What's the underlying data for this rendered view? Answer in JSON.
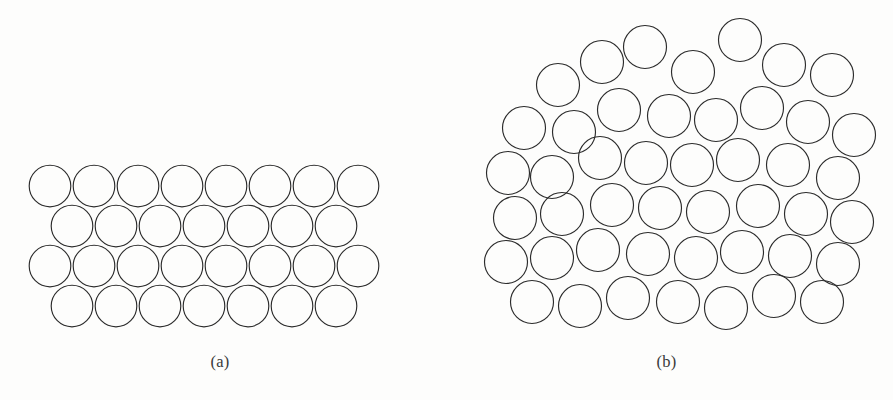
{
  "figure": {
    "title": "Schematic diagrams of atomic packing: crystalline versus amorphous solids",
    "background_color": "#fdfdfc",
    "stroke_color": "#2b2b2b",
    "fill_color": "none",
    "stroke_width": 1.15,
    "width": 893,
    "height": 400
  },
  "panels": [
    {
      "id": "a",
      "caption": "(a)",
      "description": "Crystalline solid: ordered, periodic hexagonal close-packed arrangement of atoms in four rows",
      "structure_type": "crystalline",
      "atom_count": 30,
      "rows": 4,
      "row_counts": [
        8,
        7,
        8,
        7
      ],
      "circle_radius": 20.8,
      "viewbox": "0 0 440 400",
      "circles": [
        {
          "cx": 50,
          "cy": 186
        },
        {
          "cx": 94,
          "cy": 186
        },
        {
          "cx": 138,
          "cy": 186
        },
        {
          "cx": 182,
          "cy": 186
        },
        {
          "cx": 226,
          "cy": 186
        },
        {
          "cx": 270,
          "cy": 186
        },
        {
          "cx": 314,
          "cy": 186
        },
        {
          "cx": 358,
          "cy": 186
        },
        {
          "cx": 72,
          "cy": 226
        },
        {
          "cx": 116,
          "cy": 226
        },
        {
          "cx": 160,
          "cy": 226
        },
        {
          "cx": 204,
          "cy": 226
        },
        {
          "cx": 248,
          "cy": 226
        },
        {
          "cx": 292,
          "cy": 226
        },
        {
          "cx": 336,
          "cy": 226
        },
        {
          "cx": 50,
          "cy": 266
        },
        {
          "cx": 94,
          "cy": 266
        },
        {
          "cx": 138,
          "cy": 266
        },
        {
          "cx": 182,
          "cy": 266
        },
        {
          "cx": 226,
          "cy": 266
        },
        {
          "cx": 270,
          "cy": 266
        },
        {
          "cx": 314,
          "cy": 266
        },
        {
          "cx": 358,
          "cy": 266
        },
        {
          "cx": 72,
          "cy": 306
        },
        {
          "cx": 116,
          "cy": 306
        },
        {
          "cx": 160,
          "cy": 306
        },
        {
          "cx": 204,
          "cy": 306
        },
        {
          "cx": 248,
          "cy": 306
        },
        {
          "cx": 292,
          "cy": 306
        },
        {
          "cx": 336,
          "cy": 306
        }
      ]
    },
    {
      "id": "b",
      "caption": "(b)",
      "description": "Amorphous solid: disordered, non-periodic random close packing of atoms",
      "structure_type": "amorphous",
      "atom_count": 41,
      "rows": 6,
      "circle_radius": 21.5,
      "viewbox": "0 0 453 400",
      "circles": [
        {
          "cx": 118,
          "cy": 85
        },
        {
          "cx": 162,
          "cy": 62
        },
        {
          "cx": 205,
          "cy": 47
        },
        {
          "cx": 253,
          "cy": 72
        },
        {
          "cx": 300,
          "cy": 40
        },
        {
          "cx": 344,
          "cy": 65
        },
        {
          "cx": 392,
          "cy": 75
        },
        {
          "cx": 84,
          "cy": 128
        },
        {
          "cx": 134,
          "cy": 132
        },
        {
          "cx": 179,
          "cy": 110
        },
        {
          "cx": 229,
          "cy": 116
        },
        {
          "cx": 276,
          "cy": 120
        },
        {
          "cx": 322,
          "cy": 108
        },
        {
          "cx": 368,
          "cy": 122
        },
        {
          "cx": 414,
          "cy": 135
        },
        {
          "cx": 68,
          "cy": 173
        },
        {
          "cx": 112,
          "cy": 177
        },
        {
          "cx": 160,
          "cy": 158
        },
        {
          "cx": 206,
          "cy": 163
        },
        {
          "cx": 252,
          "cy": 165
        },
        {
          "cx": 298,
          "cy": 160
        },
        {
          "cx": 348,
          "cy": 165
        },
        {
          "cx": 398,
          "cy": 178
        },
        {
          "cx": 75,
          "cy": 218
        },
        {
          "cx": 122,
          "cy": 214
        },
        {
          "cx": 172,
          "cy": 205
        },
        {
          "cx": 220,
          "cy": 208
        },
        {
          "cx": 268,
          "cy": 212
        },
        {
          "cx": 318,
          "cy": 206
        },
        {
          "cx": 366,
          "cy": 214
        },
        {
          "cx": 412,
          "cy": 222
        },
        {
          "cx": 66,
          "cy": 262
        },
        {
          "cx": 112,
          "cy": 258
        },
        {
          "cx": 158,
          "cy": 250
        },
        {
          "cx": 208,
          "cy": 254
        },
        {
          "cx": 256,
          "cy": 258
        },
        {
          "cx": 302,
          "cy": 252
        },
        {
          "cx": 350,
          "cy": 256
        },
        {
          "cx": 398,
          "cy": 264
        },
        {
          "cx": 92,
          "cy": 302
        },
        {
          "cx": 140,
          "cy": 306
        },
        {
          "cx": 188,
          "cy": 298
        },
        {
          "cx": 238,
          "cy": 302
        },
        {
          "cx": 286,
          "cy": 308
        },
        {
          "cx": 334,
          "cy": 296
        },
        {
          "cx": 382,
          "cy": 302
        }
      ]
    }
  ]
}
